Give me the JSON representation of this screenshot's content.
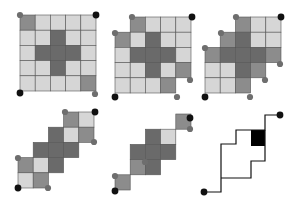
{
  "colors": {
    "background": "#ffffff",
    "light": "#d6d6d6",
    "mid": "#8c8c8c",
    "dark": "#6a6a6a",
    "grid_line": "#555555",
    "dot_black": "#111111",
    "dot_gray": "#6e6e6e",
    "path": "#111111",
    "filled_cell": "#000000"
  },
  "panels": [
    {
      "id": "panel-1",
      "origin": [
        20,
        15
      ],
      "cell": 15.2,
      "rows": [
        [
          "mid",
          "light",
          "light",
          "light",
          "light"
        ],
        [
          "light",
          "light",
          "dark",
          "light",
          "light"
        ],
        [
          "light",
          "dark",
          "dark",
          "dark",
          "light"
        ],
        [
          "light",
          "light",
          "dark",
          "light",
          "light"
        ],
        [
          "light",
          "light",
          "light",
          "light",
          "mid"
        ]
      ],
      "dots": [
        {
          "x": 20,
          "y": 15,
          "c": "gray"
        },
        {
          "x": 96,
          "y": 15,
          "c": "black"
        },
        {
          "x": 20,
          "y": 93,
          "c": "black"
        },
        {
          "x": 95,
          "y": 94,
          "c": "gray"
        }
      ]
    },
    {
      "id": "panel-2",
      "origin": [
        115,
        17
      ],
      "cell": 15.2,
      "rows": [
        [
          null,
          "mid",
          "light",
          "light",
          "light"
        ],
        [
          "mid",
          "light",
          "dark",
          "light",
          "light"
        ],
        [
          "light",
          "dark",
          "dark",
          "dark",
          "light"
        ],
        [
          "light",
          "light",
          "dark",
          "light",
          "mid"
        ],
        [
          "light",
          "light",
          "light",
          "mid",
          null
        ]
      ],
      "dots": [
        {
          "x": 132,
          "y": 17,
          "c": "gray"
        },
        {
          "x": 192,
          "y": 17,
          "c": "black"
        },
        {
          "x": 115,
          "y": 33,
          "c": "gray"
        },
        {
          "x": 190,
          "y": 80,
          "c": "gray"
        },
        {
          "x": 115,
          "y": 97,
          "c": "black"
        },
        {
          "x": 177,
          "y": 97,
          "c": "gray"
        }
      ]
    },
    {
      "id": "panel-3",
      "origin": [
        205,
        17
      ],
      "cell": 15.2,
      "rows": [
        [
          null,
          null,
          "mid",
          "light",
          "light"
        ],
        [
          null,
          "mid",
          "dark",
          "light",
          "light"
        ],
        [
          "mid",
          "dark",
          "dark",
          "dark",
          "mid"
        ],
        [
          "light",
          "light",
          "dark",
          "mid",
          null
        ],
        [
          "light",
          "light",
          "mid",
          null,
          null
        ]
      ],
      "dots": [
        {
          "x": 236,
          "y": 17,
          "c": "gray"
        },
        {
          "x": 281,
          "y": 17,
          "c": "black"
        },
        {
          "x": 221,
          "y": 33,
          "c": "gray"
        },
        {
          "x": 205,
          "y": 48,
          "c": "gray"
        },
        {
          "x": 280,
          "y": 64,
          "c": "gray"
        },
        {
          "x": 265,
          "y": 80,
          "c": "gray"
        },
        {
          "x": 205,
          "y": 97,
          "c": "black"
        },
        {
          "x": 250,
          "y": 97,
          "c": "gray"
        }
      ]
    },
    {
      "id": "panel-4",
      "origin": [
        18,
        112
      ],
      "cell": 15.2,
      "rows": [
        [
          null,
          null,
          null,
          "mid",
          "light"
        ],
        [
          null,
          null,
          "dark",
          "light",
          "mid"
        ],
        [
          null,
          "dark",
          "dark",
          "dark",
          null
        ],
        [
          "mid",
          "light",
          "dark",
          null,
          null
        ],
        [
          "light",
          "mid",
          null,
          null,
          null
        ]
      ],
      "dots": [
        {
          "x": 65,
          "y": 112,
          "c": "gray"
        },
        {
          "x": 95,
          "y": 112,
          "c": "black"
        },
        {
          "x": 94,
          "y": 142,
          "c": "gray"
        },
        {
          "x": 18,
          "y": 158,
          "c": "gray"
        },
        {
          "x": 18,
          "y": 188,
          "c": "black"
        },
        {
          "x": 48,
          "y": 188,
          "c": "gray"
        }
      ]
    },
    {
      "id": "panel-5",
      "origin": [
        115,
        114
      ],
      "cell": 15.2,
      "rows": [
        [
          null,
          null,
          null,
          null,
          "mid"
        ],
        [
          null,
          null,
          "dark",
          "light",
          null
        ],
        [
          null,
          "dark",
          "dark",
          "dark",
          null
        ],
        [
          null,
          "mid",
          "dark",
          null,
          null
        ],
        [
          "mid",
          null,
          null,
          null,
          null
        ]
      ],
      "dots": [
        {
          "x": 190,
          "y": 118,
          "c": "black"
        },
        {
          "x": 190,
          "y": 129,
          "c": "gray"
        },
        {
          "x": 145,
          "y": 162,
          "c": "gray"
        },
        {
          "x": 115,
          "y": 176,
          "c": "gray"
        },
        {
          "x": 115,
          "y": 191,
          "c": "black"
        }
      ]
    },
    {
      "id": "panel-6",
      "outer_path": [
        [
          204,
          192
        ],
        [
          221,
          192
        ],
        [
          221,
          144
        ],
        [
          236,
          144
        ],
        [
          236,
          130
        ],
        [
          265,
          130
        ],
        [
          265,
          115
        ],
        [
          280,
          115
        ]
      ],
      "inner_path": [
        [
          221,
          178
        ],
        [
          251,
          178
        ],
        [
          251,
          161
        ],
        [
          265,
          161
        ],
        [
          265,
          130
        ]
      ],
      "filled_cell": {
        "x": 251,
        "y": 130,
        "w": 14,
        "h": 16
      },
      "dots": [
        {
          "x": 204,
          "y": 192,
          "c": "black"
        },
        {
          "x": 280,
          "y": 115,
          "c": "black"
        }
      ]
    }
  ]
}
